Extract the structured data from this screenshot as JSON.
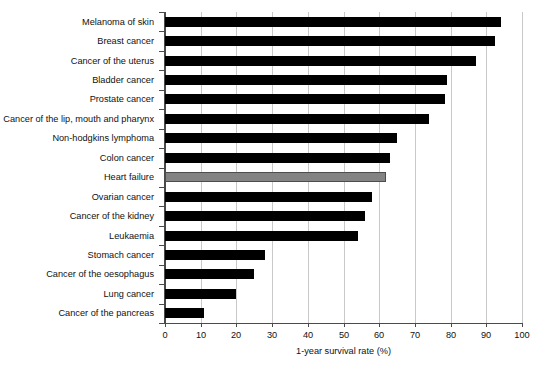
{
  "chart_data": {
    "type": "bar",
    "orientation": "horizontal",
    "title": "",
    "xlabel": "1-year survival rate (%)",
    "ylabel": "",
    "xlim": [
      0,
      100
    ],
    "xticks": [
      0,
      10,
      20,
      30,
      40,
      50,
      60,
      70,
      80,
      90,
      100
    ],
    "grid": "vertical",
    "legend": "none",
    "categories": [
      "Melanoma of skin",
      "Breast cancer",
      "Cancer of the uterus",
      "Bladder cancer",
      "Prostate cancer",
      "Cancer of the lip, mouth and pharynx",
      "Non-hodgkins lymphoma",
      "Colon cancer",
      "Heart failure",
      "Ovarian cancer",
      "Cancer of the kidney",
      "Leukaemia",
      "Stomach cancer",
      "Cancer of the oesophagus",
      "Lung cancer",
      "Cancer of the pancreas"
    ],
    "values": [
      94,
      92.5,
      87,
      79,
      78.5,
      74,
      65,
      63,
      62,
      58,
      56,
      54,
      28,
      25,
      20,
      11
    ],
    "highlight_category": "Heart failure",
    "colors": {
      "bar": "#000000",
      "highlight_bar": "#838383",
      "highlight_bar_edge": "#4d4d4d",
      "gridline": "#c8c8c8",
      "axis": "#4a4a4a",
      "text": "#111111",
      "background": "#ffffff"
    }
  }
}
